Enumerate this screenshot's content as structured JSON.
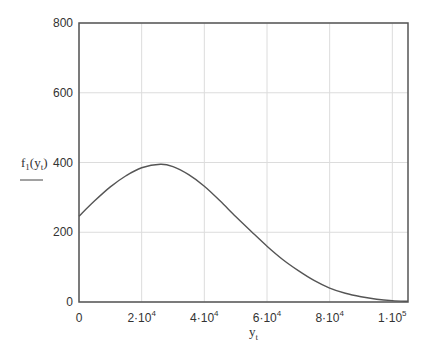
{
  "chart_data": {
    "type": "line",
    "title": "",
    "xlabel": "y_t",
    "ylabel": "f_1(y_t)",
    "xlim": [
      0,
      105000
    ],
    "ylim": [
      0,
      800
    ],
    "grid": true,
    "legend": null,
    "x_ticks": [
      {
        "value": 0,
        "base": "0",
        "exp": ""
      },
      {
        "value": 20000,
        "base": "2·10",
        "exp": "4"
      },
      {
        "value": 40000,
        "base": "4·10",
        "exp": "4"
      },
      {
        "value": 60000,
        "base": "6·10",
        "exp": "4"
      },
      {
        "value": 80000,
        "base": "8·10",
        "exp": "4"
      },
      {
        "value": 100000,
        "base": "1·10",
        "exp": "5"
      }
    ],
    "y_ticks": [
      0,
      200,
      400,
      600,
      800
    ],
    "series": [
      {
        "name": "f1(yt)",
        "color": "#555555",
        "x": [
          0,
          5000,
          10000,
          15000,
          20000,
          26000,
          30000,
          35000,
          40000,
          45000,
          50000,
          55000,
          60000,
          65000,
          70000,
          75000,
          80000,
          85000,
          90000,
          95000,
          100000,
          105000
        ],
        "y": [
          246,
          290,
          330,
          362,
          385,
          395,
          388,
          365,
          332,
          290,
          245,
          202,
          160,
          122,
          90,
          62,
          40,
          25,
          15,
          8,
          4,
          2
        ]
      }
    ]
  },
  "labels": {
    "y_label_main": "f",
    "y_label_sub": "1",
    "y_label_arg": "y",
    "y_label_arg_sub": "t",
    "x_label_main": "y",
    "x_label_sub": "t"
  }
}
